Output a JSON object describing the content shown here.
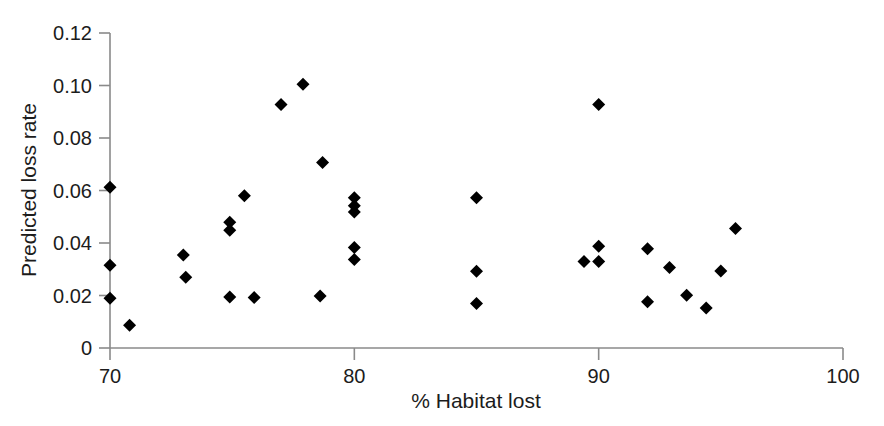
{
  "chart_data": {
    "type": "scatter",
    "title": "",
    "subtitle": "",
    "xlabel": "% Habitat lost",
    "ylabel": "Predicted loss rate",
    "xlim": [
      70,
      100
    ],
    "ylim": [
      0,
      0.12
    ],
    "xticks": [
      70,
      80,
      90,
      100
    ],
    "xtick_labels": [
      "70",
      "80",
      "90",
      "100"
    ],
    "yticks": [
      0,
      0.02,
      0.04,
      0.06,
      0.08,
      0.1,
      0.12
    ],
    "ytick_labels": [
      "0",
      "0.02",
      "0.04",
      "0.06",
      "0.08",
      "0.10",
      "0.12"
    ],
    "grid": false,
    "legend": null,
    "legend_position": "none",
    "marker": "diamond",
    "marker_color": "#000000",
    "marker_size": 11,
    "axis_color": "#8a8a8a",
    "series": [
      {
        "name": "Predicted loss rate",
        "points": [
          {
            "x": 70.0,
            "y": 0.0612
          },
          {
            "x": 70.0,
            "y": 0.0315
          },
          {
            "x": 70.0,
            "y": 0.019
          },
          {
            "x": 70.8,
            "y": 0.0087
          },
          {
            "x": 73.0,
            "y": 0.0354
          },
          {
            "x": 73.1,
            "y": 0.027
          },
          {
            "x": 74.9,
            "y": 0.0479
          },
          {
            "x": 74.9,
            "y": 0.0449
          },
          {
            "x": 75.5,
            "y": 0.058
          },
          {
            "x": 74.9,
            "y": 0.0194
          },
          {
            "x": 75.9,
            "y": 0.0192
          },
          {
            "x": 77.0,
            "y": 0.0928
          },
          {
            "x": 77.9,
            "y": 0.1005
          },
          {
            "x": 78.7,
            "y": 0.0707
          },
          {
            "x": 78.6,
            "y": 0.0198
          },
          {
            "x": 80.0,
            "y": 0.0572
          },
          {
            "x": 80.0,
            "y": 0.0542
          },
          {
            "x": 80.0,
            "y": 0.0518
          },
          {
            "x": 80.0,
            "y": 0.0383
          },
          {
            "x": 80.0,
            "y": 0.0337
          },
          {
            "x": 85.0,
            "y": 0.0572
          },
          {
            "x": 85.0,
            "y": 0.0292
          },
          {
            "x": 85.0,
            "y": 0.017
          },
          {
            "x": 89.4,
            "y": 0.033
          },
          {
            "x": 90.0,
            "y": 0.0928
          },
          {
            "x": 90.0,
            "y": 0.0388
          },
          {
            "x": 90.0,
            "y": 0.033
          },
          {
            "x": 92.0,
            "y": 0.0378
          },
          {
            "x": 92.0,
            "y": 0.0176
          },
          {
            "x": 92.9,
            "y": 0.0307
          },
          {
            "x": 93.6,
            "y": 0.0201
          },
          {
            "x": 94.4,
            "y": 0.0152
          },
          {
            "x": 95.0,
            "y": 0.0293
          },
          {
            "x": 95.6,
            "y": 0.0455
          }
        ]
      }
    ]
  },
  "figure": {
    "background_color": "#ffffff",
    "caption": ""
  }
}
